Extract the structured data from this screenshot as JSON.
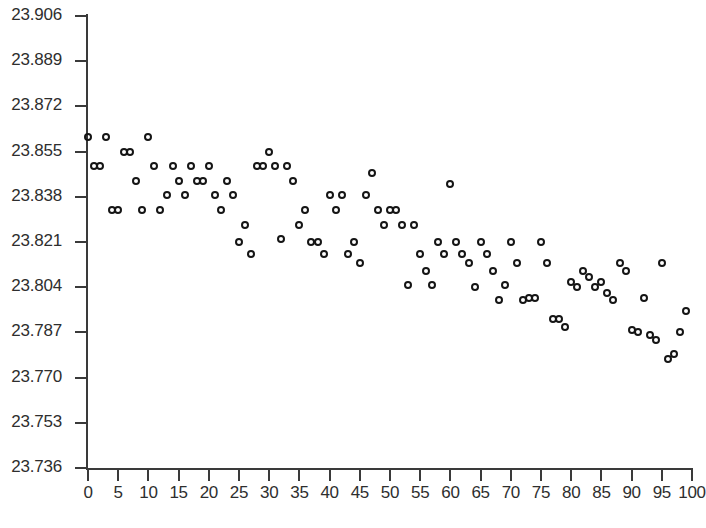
{
  "chart_data": {
    "type": "scatter",
    "title": "",
    "subtitle": "",
    "xlabel": "",
    "ylabel": "",
    "xlim": [
      0,
      100
    ],
    "ylim": [
      23.736,
      23.906
    ],
    "grid": false,
    "legend": null,
    "marker": "open-circle",
    "marker_color": "#151515",
    "xticks": [
      0,
      5,
      10,
      15,
      20,
      25,
      30,
      35,
      40,
      45,
      50,
      55,
      60,
      65,
      70,
      75,
      80,
      85,
      90,
      95,
      100
    ],
    "xtick_labels": [
      "0",
      "5",
      "10",
      "15",
      "20",
      "25",
      "30",
      "35",
      "40",
      "45",
      "50",
      "55",
      "60",
      "65",
      "70",
      "75",
      "80",
      "85",
      "90",
      "95",
      "100"
    ],
    "yticks": [
      23.906,
      23.889,
      23.872,
      23.855,
      23.838,
      23.821,
      23.804,
      23.787,
      23.77,
      23.753,
      23.736
    ],
    "ytick_labels": [
      "23.906",
      "23.889",
      "23.872",
      "23.855",
      "23.838",
      "23.821",
      "23.804",
      "23.787",
      "23.770",
      "23.753",
      "23.736"
    ],
    "ytick_step": 0.017,
    "n_points": 100,
    "series": [
      {
        "name": "measurement",
        "x": [
          0,
          1,
          2,
          3,
          4,
          5,
          6,
          7,
          8,
          9,
          10,
          11,
          12,
          13,
          14,
          15,
          16,
          17,
          18,
          19,
          20,
          21,
          22,
          23,
          24,
          25,
          26,
          27,
          28,
          29,
          30,
          31,
          32,
          33,
          34,
          35,
          36,
          37,
          38,
          39,
          40,
          41,
          42,
          43,
          44,
          45,
          46,
          47,
          48,
          49,
          50,
          51,
          52,
          53,
          54,
          55,
          56,
          57,
          58,
          59,
          60,
          61,
          62,
          63,
          64,
          65,
          66,
          67,
          68,
          69,
          70,
          71,
          72,
          73,
          74,
          75,
          76,
          77,
          78,
          79,
          80,
          81,
          82,
          83,
          84,
          85,
          86,
          87,
          88,
          89,
          90,
          91,
          92,
          93,
          94,
          95,
          96,
          97,
          98,
          99
        ],
        "y": [
          23.8605,
          23.8495,
          23.8495,
          23.8605,
          23.833,
          23.833,
          23.855,
          23.855,
          23.844,
          23.833,
          23.8605,
          23.8495,
          23.833,
          23.8385,
          23.8495,
          23.844,
          23.8385,
          23.8495,
          23.844,
          23.844,
          23.8495,
          23.8385,
          23.833,
          23.844,
          23.8385,
          23.821,
          23.8275,
          23.8165,
          23.8495,
          23.8495,
          23.855,
          23.8495,
          23.822,
          23.8495,
          23.844,
          23.8275,
          23.833,
          23.821,
          23.821,
          23.8165,
          23.8385,
          23.833,
          23.8385,
          23.8165,
          23.821,
          23.813,
          23.8385,
          23.847,
          23.833,
          23.8275,
          23.833,
          23.833,
          23.8275,
          23.805,
          23.8275,
          23.8165,
          23.81,
          23.805,
          23.821,
          23.8165,
          23.843,
          23.821,
          23.8165,
          23.813,
          23.804,
          23.821,
          23.8165,
          23.81,
          23.799,
          23.805,
          23.821,
          23.813,
          23.799,
          23.8,
          23.8,
          23.821,
          23.813,
          23.792,
          23.792,
          23.789,
          23.806,
          23.804,
          23.81,
          23.808,
          23.804,
          23.806,
          23.802,
          23.799,
          23.813,
          23.81,
          23.788,
          23.787,
          23.8,
          23.786,
          23.784,
          23.813,
          23.777,
          23.779,
          23.787,
          23.795
        ]
      }
    ]
  }
}
